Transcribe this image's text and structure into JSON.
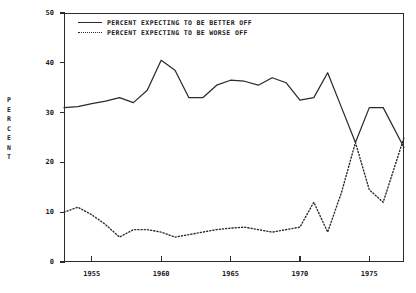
{
  "axis": {
    "ylabel_letters": [
      "P",
      "E",
      "R",
      "C",
      "E",
      "N",
      "T"
    ],
    "ylabel": "PERCENT",
    "yticks": [
      0,
      10,
      20,
      30,
      40,
      50
    ],
    "xticks": [
      1955,
      1960,
      1965,
      1970,
      1975
    ]
  },
  "legend": {
    "items": [
      {
        "label": "PERCENT EXPECTING TO BE BETTER OFF",
        "style": "solid"
      },
      {
        "label": "PERCENT EXPECTING TO BE WORSE OFF",
        "style": "dotted"
      }
    ]
  },
  "colors": {
    "line": "#2b2b2b",
    "background": "#ffffff",
    "text": "#1a1a1a"
  },
  "chart_data": {
    "type": "line",
    "title": "",
    "xlabel": "",
    "ylabel": "PERCENT",
    "xlim": [
      1953,
      1977.5
    ],
    "ylim": [
      0,
      50
    ],
    "grid": false,
    "legend_position": "top-left-inside",
    "x": [
      1953,
      1954,
      1955,
      1956,
      1957,
      1958,
      1959,
      1960,
      1961,
      1962,
      1963,
      1964,
      1965,
      1966,
      1967,
      1968,
      1969,
      1970,
      1971,
      1972,
      1973,
      1974,
      1975,
      1976,
      1977.5
    ],
    "series": [
      {
        "name": "PERCENT EXPECTING TO BE BETTER OFF",
        "style": "solid",
        "values": [
          31.0,
          31.2,
          31.8,
          32.3,
          33.0,
          32.0,
          34.5,
          40.5,
          38.5,
          33.0,
          33.0,
          35.5,
          36.5,
          36.3,
          35.5,
          37.0,
          36.0,
          32.5,
          33.0,
          38.0,
          31.0,
          24.0,
          31.0,
          31.0,
          23.0
        ]
      },
      {
        "name": "PERCENT EXPECTING TO BE WORSE OFF",
        "style": "dotted",
        "values": [
          10.0,
          11.0,
          9.5,
          7.5,
          5.0,
          6.5,
          6.5,
          6.0,
          5.0,
          5.5,
          6.0,
          6.5,
          6.8,
          7.0,
          6.5,
          6.0,
          6.5,
          7.0,
          12.0,
          6.0,
          14.0,
          24.0,
          14.5,
          12.0,
          25.0
        ]
      }
    ]
  }
}
